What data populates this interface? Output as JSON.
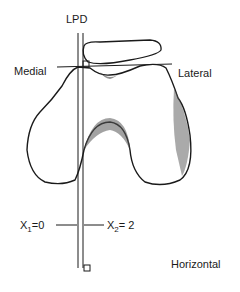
{
  "diagram": {
    "labels": {
      "top": "LPD",
      "left": "Medial",
      "right": "Lateral",
      "bottom_right": "Horizontal"
    },
    "measurements": {
      "x1_var": "X",
      "x1_sub": "1",
      "x1_val": "=0",
      "x2_var": "X",
      "x2_sub": "2",
      "x2_val": "= 2"
    },
    "colors": {
      "line": "#1a1a1a",
      "background": "#ffffff"
    }
  }
}
